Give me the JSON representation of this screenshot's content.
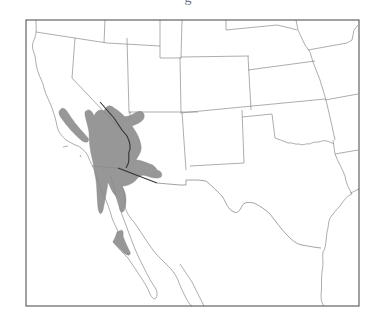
{
  "figure": {
    "caption_fragment": "g",
    "type": "distribution range map",
    "region": "Southwestern United States and northwestern Mexico",
    "colors": {
      "background": "#ffffff",
      "frame": "#555555",
      "boundaries": "#8a8a8a",
      "range_fill": "#8f8f8f"
    },
    "layers": [
      {
        "name": "frame",
        "label": ""
      },
      {
        "name": "state-boundaries",
        "label": ""
      },
      {
        "name": "coastline",
        "label": ""
      },
      {
        "name": "species-range",
        "label": ""
      }
    ]
  }
}
